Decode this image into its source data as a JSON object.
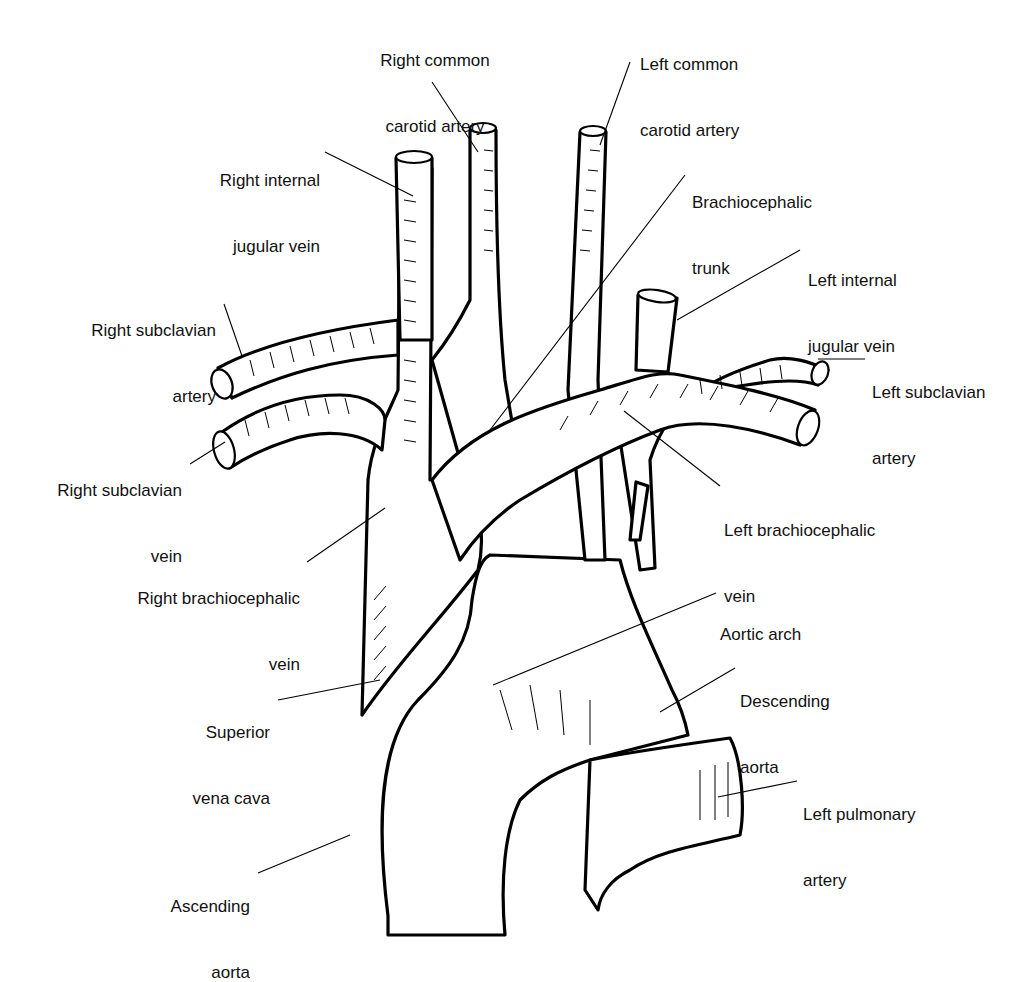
{
  "diagram": {
    "style": "black-and-white line illustration",
    "labels": [
      {
        "id": "right-common-carotid-artery",
        "line1": "Right common",
        "line2": "carotid artery"
      },
      {
        "id": "left-common-carotid-artery",
        "line1": "Left common",
        "line2": "carotid artery"
      },
      {
        "id": "right-internal-jugular-vein",
        "line1": "Right internal",
        "line2": "jugular vein"
      },
      {
        "id": "brachiocephalic-trunk",
        "line1": "Brachiocephalic",
        "line2": "trunk"
      },
      {
        "id": "left-internal-jugular-vein",
        "line1": "Left internal",
        "line2": "jugular vein"
      },
      {
        "id": "right-subclavian-artery",
        "line1": "Right subclavian",
        "line2": "artery"
      },
      {
        "id": "left-subclavian-artery",
        "line1": "Left subclavian",
        "line2": "artery"
      },
      {
        "id": "right-subclavian-vein",
        "line1": "Right subclavian",
        "line2": "vein"
      },
      {
        "id": "left-brachiocephalic-vein",
        "line1": "Left brachiocephalic",
        "line2": "vein"
      },
      {
        "id": "right-brachiocephalic-vein",
        "line1": "Right brachiocephalic",
        "line2": "vein"
      },
      {
        "id": "aortic-arch",
        "line1": "Aortic arch",
        "line2": ""
      },
      {
        "id": "descending-aorta",
        "line1": "Descending",
        "line2": "aorta"
      },
      {
        "id": "superior-vena-cava",
        "line1": "Superior",
        "line2": "vena cava"
      },
      {
        "id": "left-pulmonary-artery",
        "line1": "Left pulmonary",
        "line2": "artery"
      },
      {
        "id": "ascending-aorta",
        "line1": "Ascending",
        "line2": "aorta"
      }
    ]
  }
}
